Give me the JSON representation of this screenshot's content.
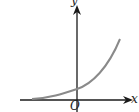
{
  "diagram": {
    "type": "function-graph",
    "function": "exponential growth (y = a^x, a > 1)",
    "axes": {
      "x_label": "x",
      "y_label": "y",
      "origin_label": "O"
    },
    "colors": {
      "axis": "#1a1a1a",
      "curve": "#8a8a8a",
      "background": "#ffffff"
    },
    "curve_points_px": [
      [
        32,
        99
      ],
      [
        50,
        97
      ],
      [
        65,
        93
      ],
      [
        77,
        89
      ],
      [
        90,
        82
      ],
      [
        102,
        70
      ],
      [
        112,
        55
      ],
      [
        120,
        39
      ]
    ]
  }
}
